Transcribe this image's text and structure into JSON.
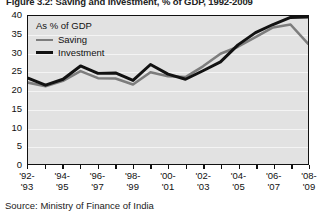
{
  "figure": {
    "title": "Figure 3.2: Saving and Investment, % of GDP, 1992-2009",
    "source": "Source: Ministry of Finance of India"
  },
  "legend": {
    "heading": "As % of GDP",
    "saving_label": "Saving",
    "investment_label": "Investment",
    "saving_color": "#7d7d7d",
    "investment_color": "#121212"
  },
  "chart_data": {
    "type": "line",
    "title": "Figure 3.2: Saving and Investment, % of GDP, 1992-2009",
    "xlabel": "",
    "ylabel": "As % of GDP",
    "ylim": [
      0,
      40
    ],
    "yticks": [
      0,
      5,
      10,
      15,
      20,
      25,
      30,
      35,
      40
    ],
    "grid": true,
    "legend_position": "top-left",
    "plot_background": "#e2e2e2",
    "categories": [
      "'92-'93",
      "'93-'94",
      "'94-'95",
      "'95-'96",
      "'96-'97",
      "'97-'98",
      "'98-'99",
      "'99-'00",
      "'00-'01",
      "'01-'02",
      "'02-'03",
      "'03-'04",
      "'04-'05",
      "'05-'06",
      "'06-'07",
      "'07-'08",
      "'08-'09"
    ],
    "tick_labels": [
      {
        "line1": "'92-",
        "line2": "'93"
      },
      {
        "line1": "'94-",
        "line2": "'95"
      },
      {
        "line1": "'96-",
        "line2": "'97"
      },
      {
        "line1": "'98-",
        "line2": "'99"
      },
      {
        "line1": "'00-",
        "line2": "'01"
      },
      {
        "line1": "'02-",
        "line2": "'03"
      },
      {
        "line1": "'04-",
        "line2": "'05"
      },
      {
        "line1": "'06-",
        "line2": "'07"
      },
      {
        "line1": "'08-",
        "line2": "'09"
      }
    ],
    "series": [
      {
        "name": "Saving",
        "color": "#7d7d7d",
        "values": [
          22.0,
          21.0,
          22.5,
          25.1,
          23.2,
          23.1,
          21.5,
          24.8,
          23.7,
          23.5,
          26.4,
          29.8,
          31.7,
          34.3,
          36.9,
          37.7,
          32.5
        ]
      },
      {
        "name": "Investment",
        "color": "#121212",
        "values": [
          23.2,
          21.3,
          22.9,
          26.5,
          24.5,
          24.6,
          22.6,
          26.9,
          24.3,
          22.9,
          25.2,
          27.6,
          32.2,
          35.5,
          37.7,
          39.6,
          39.7
        ]
      }
    ]
  }
}
